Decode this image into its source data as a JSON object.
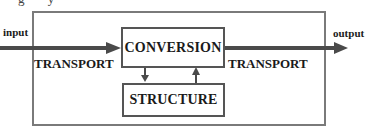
{
  "diagram": {
    "caption_fragment": "g y",
    "input_label": "input",
    "output_label": "output",
    "transport_left_label": "TRANSPORT",
    "transport_right_label": "TRANSPORT",
    "conversion_label": "CONVERSION",
    "structure_label": "STRUCTURE",
    "colors": {
      "arrow": "#4a4a4a",
      "outer_border": "#7a7a7a",
      "inner_border": "#555555",
      "text": "#1a1a1a",
      "background": "#ffffff"
    },
    "edges": [
      {
        "from": "input",
        "to": "CONVERSION",
        "label": "TRANSPORT"
      },
      {
        "from": "CONVERSION",
        "to": "output",
        "label": "TRANSPORT"
      },
      {
        "from": "CONVERSION",
        "to": "STRUCTURE",
        "label": ""
      },
      {
        "from": "STRUCTURE",
        "to": "CONVERSION",
        "label": ""
      }
    ]
  }
}
